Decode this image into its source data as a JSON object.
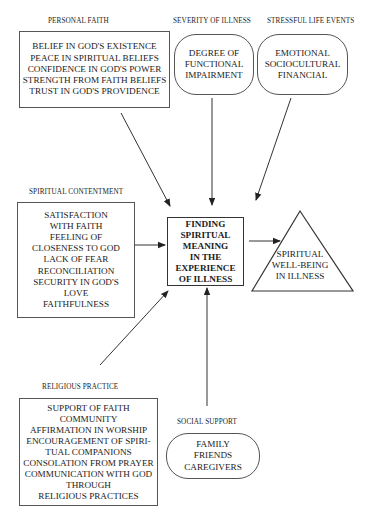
{
  "diagram": {
    "top_cut_text": "",
    "nodes": {
      "personal_faith": {
        "heading": "PERSONAL FAITH",
        "lines": [
          "BELIEF IN GOD'S EXISTENCE",
          "PEACE IN SPIRITUAL BELIEFS",
          "CONFIDENCE IN GOD'S POWER",
          "STRENGTH FROM FAITH BELIEFS",
          "TRUST IN GOD'S PROVIDENCE"
        ]
      },
      "severity_of_illness": {
        "heading": "SEVERITY OF ILLNESS",
        "lines": [
          "DEGREE OF",
          "FUNCTIONAL",
          "IMPAIRMENT"
        ]
      },
      "stressful_life_events": {
        "heading": "STRESSFUL LIFE EVENTS",
        "lines": [
          "EMOTIONAL",
          "SOCIOCULTURAL",
          "FINANCIAL"
        ]
      },
      "spiritual_contentment": {
        "heading": "SPIRITUAL CONTENTMENT",
        "lines": [
          "SATISFACTION",
          "WITH FAITH",
          "FEELING OF",
          "CLOSENESS TO GOD",
          "LACK OF FEAR",
          "RECONCILIATION",
          "SECURITY IN GOD'S",
          "LOVE",
          "FAITHFULNESS"
        ]
      },
      "finding_meaning": {
        "lines": [
          "FINDING",
          "SPIRITUAL",
          "MEANING",
          "IN THE",
          "EXPERIENCE",
          "OF ILLNESS"
        ]
      },
      "spiritual_well_being": {
        "lines": [
          "SPIRITUAL",
          "WELL-BEING",
          "IN ILLNESS"
        ]
      },
      "religious_practice": {
        "heading": "RELIGIOUS PRACTICE",
        "lines": [
          "SUPPORT OF FAITH",
          "COMMUNITY",
          "AFFIRMATION IN WORSHIP",
          "ENCOURAGEMENT OF SPIRI-",
          "TUAL COMPANIONS",
          "CONSOLATION FROM PRAYER",
          "COMMUNICATION WITH GOD",
          "THROUGH",
          "RELIGIOUS PRACTICES"
        ]
      },
      "social_support": {
        "heading": "SOCIAL SUPPORT",
        "lines": [
          "FAMILY",
          "FRIENDS",
          "CAREGIVERS"
        ]
      }
    },
    "edges": [
      {
        "from": "personal_faith",
        "to": "finding_meaning"
      },
      {
        "from": "severity_of_illness",
        "to": "finding_meaning"
      },
      {
        "from": "stressful_life_events",
        "to": "finding_meaning"
      },
      {
        "from": "spiritual_contentment",
        "to": "finding_meaning"
      },
      {
        "from": "religious_practice",
        "to": "finding_meaning"
      },
      {
        "from": "social_support",
        "to": "finding_meaning"
      },
      {
        "from": "finding_meaning",
        "to": "spiritual_well_being"
      }
    ],
    "colors": {
      "line": "#333333",
      "box_border": "#555555",
      "text": "#222222",
      "background": "#ffffff"
    }
  }
}
